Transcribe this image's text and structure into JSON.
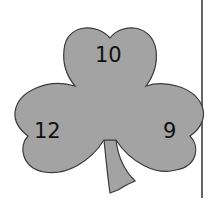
{
  "figure": {
    "shape": "shamrock",
    "fill_color": "#a3a3a3",
    "outline_color": "#3a3a3a",
    "leaves": [
      {
        "position": "top",
        "label": "10"
      },
      {
        "position": "left",
        "label": "12"
      },
      {
        "position": "right",
        "label": "9"
      }
    ],
    "divider_color": "#333333"
  }
}
